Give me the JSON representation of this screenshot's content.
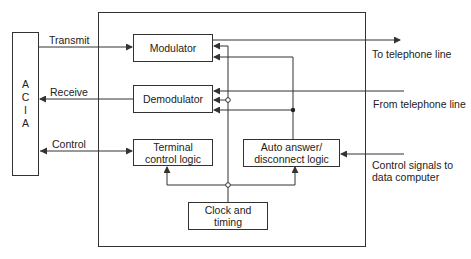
{
  "diagram": {
    "acia": {
      "letters": [
        "A",
        "C",
        "I",
        "A"
      ]
    },
    "blocks": {
      "modulator": "Modulator",
      "demodulator": "Demodulator",
      "terminal_control_line1": "Terminal",
      "terminal_control_line2": "control logic",
      "auto_answer_line1": "Auto answer/",
      "auto_answer_line2": "disconnect logic",
      "clock_line1": "Clock and",
      "clock_line2": "timing"
    },
    "signals": {
      "transmit": "Transmit",
      "receive": "Receive",
      "control": "Control",
      "to_telephone": "To telephone line",
      "from_telephone": "From telephone line",
      "control_signals_line1": "Control signals to",
      "control_signals_line2": "data computer"
    },
    "colors": {
      "line": "#333333",
      "background": "#ffffff"
    }
  }
}
